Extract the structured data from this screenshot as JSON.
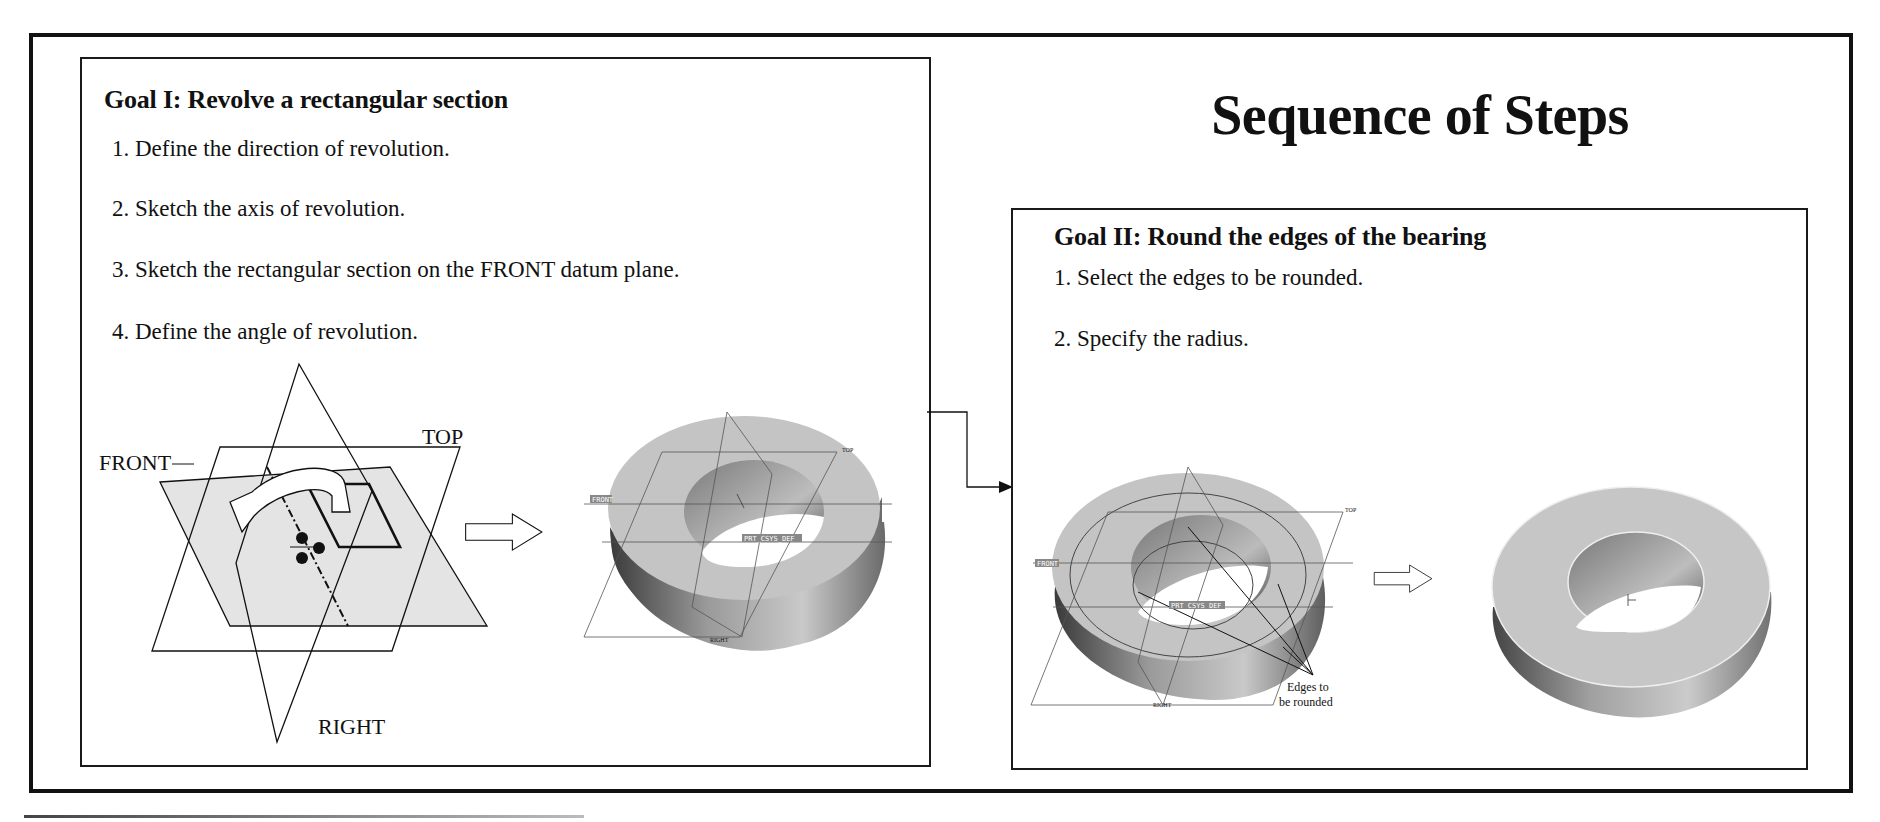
{
  "title": "Sequence of Steps",
  "goals": [
    {
      "title": "Goal I: Revolve a rectangular section",
      "steps": [
        "1. Define the direction of revolution.",
        "2. Sketch the axis of revolution.",
        "3. Sketch the rectangular section on the FRONT datum plane.",
        "4. Define the angle of revolution."
      ],
      "sketch_labels": {
        "front": "FRONT",
        "top": "TOP",
        "right": "RIGHT"
      },
      "model_labels": {
        "front": "FRONT",
        "top": "TOP",
        "right": "RIGHT",
        "csys": "PRT_CSYS_DEF"
      }
    },
    {
      "title": "Goal II: Round the edges of the bearing",
      "steps": [
        "1. Select the edges to be rounded.",
        "2. Specify the radius."
      ],
      "model_labels": {
        "front": "FRONT",
        "top": "TOP",
        "right": "RIGHT",
        "csys": "PRT_CSYS_DEF"
      },
      "callout": {
        "line1": "Edges to",
        "line2": "be rounded"
      }
    }
  ],
  "colors": {
    "line": "#111111",
    "plane_fill": "#e4e4e4",
    "solid_top": "#c8c8c8",
    "solid_side_dark": "#5a5a5a",
    "hole": "#ffffff"
  }
}
